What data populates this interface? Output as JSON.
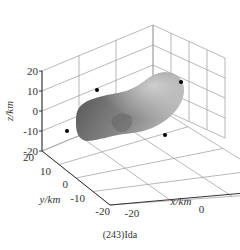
{
  "chart_data": {
    "type": "surface3d",
    "title": "",
    "caption": "(243)Ida",
    "note": "Rendered 3D surface of asteroid (243) Ida shown inside a 3D box with grid walls. The underlying surface x/y/z values are not shown in the image; marker coordinates and surface extent below are approximate visual estimates from pixel positions, not measured data.",
    "xlabel": "x/km",
    "ylabel": "y/km",
    "zlabel": "z/km",
    "x_ticks": [
      "-20",
      "0",
      "20"
    ],
    "y_ticks": [
      "20",
      "10",
      "0",
      "-10",
      "-20"
    ],
    "z_ticks": [
      "20",
      "10",
      "0",
      "-10",
      "-20"
    ],
    "xlim": [
      -30,
      30
    ],
    "ylim": [
      -25,
      25
    ],
    "zlim": [
      -25,
      25
    ],
    "grid": true,
    "surface_color": "#7a7a7a",
    "marker_color": "#000000",
    "markers_approximate": true,
    "markers": [
      {
        "x": -14,
        "y": 25,
        "z": 8
      },
      {
        "x": 28,
        "y": 4,
        "z": 6
      },
      {
        "x": -28,
        "y": 8,
        "z": -12
      },
      {
        "x": 14,
        "y": -18,
        "z": -10
      }
    ]
  }
}
